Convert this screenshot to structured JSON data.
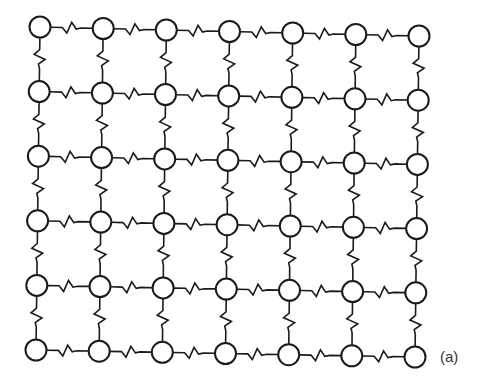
{
  "figure": {
    "label": "(a)",
    "grid": {
      "columns": 7,
      "rows": 6,
      "corners": {
        "top_left": [
          40,
          27
        ],
        "top_right": [
          419,
          36
        ],
        "bottom_left": [
          36,
          350
        ],
        "bottom_right": [
          415,
          357
        ]
      },
      "node_radius": 10.5
    },
    "colors": {
      "line": "#1a1a1a",
      "node_fill": "#ffffff",
      "background": "#ffffff",
      "label": "#333333"
    },
    "label_position": [
      440,
      362
    ]
  }
}
